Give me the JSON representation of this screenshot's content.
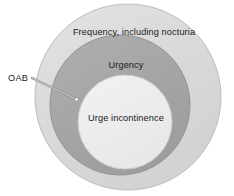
{
  "figure": {
    "name": "oab-concentric-venn-diagram",
    "background_color": "#ffffff",
    "width": 234,
    "height": 196
  },
  "diagram": {
    "type": "concentric-circles",
    "regions": [
      {
        "id": "outer",
        "label": "Frequency, including nocturia",
        "fill_color": "#dcdcdc",
        "stroke_color": "#b4b4b4",
        "center_x": 128,
        "center_y": 97,
        "radius": 93
      },
      {
        "id": "middle",
        "label": "Urgency",
        "fill_color": "#a8a8a8",
        "stroke_color": "#8c8c8c",
        "center_x": 120,
        "center_y": 105,
        "radius": 70
      },
      {
        "id": "inner",
        "label": "Urge incontinence",
        "fill_color": "#efefef",
        "stroke_color": "#c8c8c8",
        "center_x": 125,
        "center_y": 122,
        "radius": 47
      }
    ],
    "callout": {
      "label": "OAB",
      "target_region": "middle",
      "line_color": "#8a8a8a",
      "line_start_x": 32,
      "line_start_y": 78,
      "line_end_x": 76,
      "line_end_y": 99
    }
  }
}
